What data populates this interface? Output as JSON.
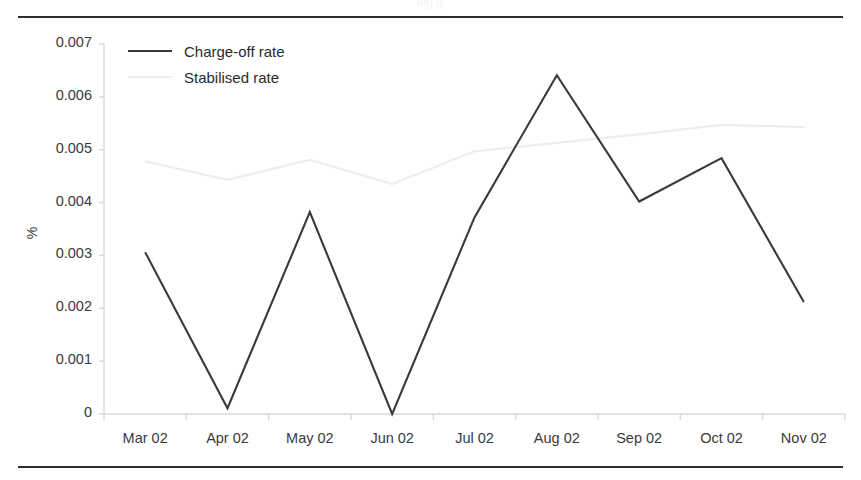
{
  "figure": {
    "caption_partial": "ing                            g"
  },
  "chart_data": {
    "type": "line",
    "title": "",
    "xlabel": "",
    "ylabel": "%",
    "categories": [
      "Mar 02",
      "Apr 02",
      "May 02",
      "Jun 02",
      "Jul 02",
      "Aug 02",
      "Sep 02",
      "Oct 02",
      "Nov 02"
    ],
    "ylim": [
      0,
      0.007
    ],
    "ytick_labels": [
      "0.007",
      "0.006",
      "0.005",
      "0.004",
      "0.003",
      "0.002",
      "0.001",
      "0"
    ],
    "ytick_values": [
      0.007,
      0.006,
      0.005,
      0.004,
      0.003,
      0.002,
      0.001,
      0
    ],
    "grid": false,
    "legend_position": "top-left",
    "series": [
      {
        "name": "Charge-off rate",
        "color": "#3a3a3a",
        "values": [
          0.00306,
          0.00011,
          0.00382,
          0.0,
          0.00372,
          0.00641,
          0.00402,
          0.00484,
          0.00212
        ]
      },
      {
        "name": "Stabilised rate",
        "color": "#ededed",
        "values": [
          0.00478,
          0.00443,
          0.00481,
          0.00435,
          0.00497,
          0.00513,
          0.00529,
          0.00547,
          0.00543
        ]
      }
    ]
  }
}
